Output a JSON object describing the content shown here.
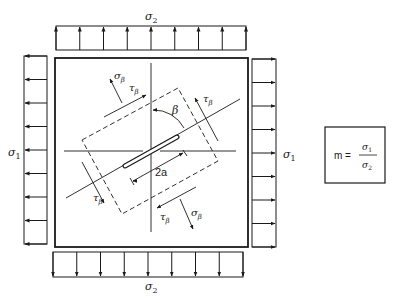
{
  "figure": {
    "type": "biaxial-loaded plate with inclined crack",
    "stroke_color": "#1a1a1a",
    "background": "#ffffff"
  },
  "loads": {
    "top": {
      "label": "σ",
      "subscript": "2",
      "arrow_count": 9,
      "direction": "up"
    },
    "bottom": {
      "label": "σ",
      "subscript": "2",
      "arrow_count": 9,
      "direction": "down"
    },
    "left": {
      "label": "σ",
      "subscript": "1",
      "arrow_count": 9,
      "direction": "left"
    },
    "right": {
      "label": "σ",
      "subscript": "1",
      "arrow_count": 9,
      "direction": "right"
    }
  },
  "crack": {
    "length_label": "2a",
    "angle_label": "β"
  },
  "element_stresses": {
    "normal_label": "σ",
    "normal_subscript": "β",
    "shear_label": "τ",
    "shear_subscript": "β"
  },
  "formula": {
    "lhs": "m =",
    "numerator": "σ",
    "numerator_sub": "1",
    "denominator": "σ",
    "denominator_sub": "2"
  }
}
